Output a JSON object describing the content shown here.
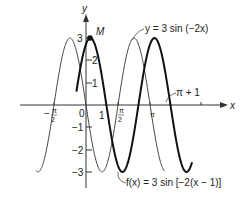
{
  "chart_data": {
    "type": "line",
    "title": "",
    "xlabel": "x",
    "ylabel": "y",
    "xlim": [
      -2.5,
      5.3
    ],
    "ylim": [
      -3.9,
      3.7
    ],
    "grid": false,
    "x_ticks": [
      "-π/2",
      "0",
      "1",
      "π/2",
      "π",
      "π + 1"
    ],
    "y_ticks": [
      "-3",
      "-2",
      "-1",
      "1",
      "2",
      "3"
    ],
    "series": [
      {
        "name": "y = 3 sin (−2x)",
        "expression": "3*sin(-2*x)",
        "style": "thin",
        "amplitude": 3,
        "period": "π",
        "phase_shift": 0
      },
      {
        "name": "f(x) = 3 sin [−2(x − 1)]",
        "expression": "3*sin(-2*(x-1))",
        "style": "thick",
        "amplitude": 3,
        "period": "π",
        "phase_shift": 1
      }
    ],
    "annotations": [
      {
        "text": "M",
        "x": 0.215,
        "y": 3,
        "note": "maximum point of f on y-axis side"
      },
      {
        "text": "y = 3 sin (−2x)",
        "points_to": "thin curve"
      },
      {
        "text": "π + 1",
        "points_to": "x-axis crossing of f at x = π + 1"
      },
      {
        "text": "f(x) = 3 sin [−2(x − 1)]",
        "points_to": "thick curve"
      }
    ]
  },
  "labels": {
    "y_axis": "y",
    "x_axis": "x",
    "point_m": "M",
    "curve1_label": "y = 3 sin (−2x)",
    "curve2_label": "f(x) = 3 sin [−2(x − 1)]",
    "pi_plus_one": "π + 1",
    "tick_neg_pi_half_num": "π",
    "tick_neg_pi_half_den": "2",
    "tick_neg_sign": "−",
    "tick_zero": "0",
    "tick_one": "1",
    "tick_pi_half_num": "π",
    "tick_pi_half_den": "2",
    "tick_pi": "π",
    "y_3": "3",
    "y_2": "2",
    "y_1": "1",
    "y_m1": "−1",
    "y_m2": "−2",
    "y_m3": "−3"
  }
}
